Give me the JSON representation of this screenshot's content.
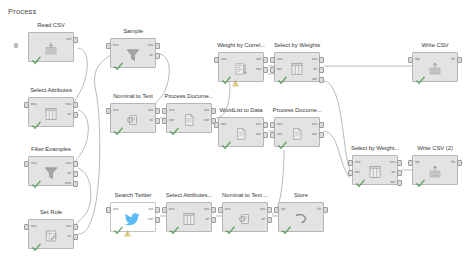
{
  "canvas": {
    "title": "Process",
    "background": "#ffffff",
    "node_fill": "#e3e3e3",
    "node_border": "#b6b6b6",
    "wire_color": "#b9b9b9",
    "text_color": "#3b3b3b",
    "twitter_blue": "#1da1f2",
    "width": 466,
    "height": 260
  },
  "nodes": [
    {
      "id": "read-csv",
      "label": "Read CSV",
      "icon": "read-csv-icon",
      "x": 28,
      "y": 32,
      "style": "grey",
      "check": true,
      "warn": false,
      "inputs": [],
      "outputs": [
        "out"
      ],
      "port_labels_in": [],
      "port_labels_out": [
        "out"
      ],
      "extra_left_nub": true
    },
    {
      "id": "select-attributes",
      "label": "Select Attributes",
      "icon": "table-columns-icon",
      "x": 28,
      "y": 97,
      "style": "grey",
      "check": true,
      "warn": false,
      "inputs": [
        "exa"
      ],
      "outputs": [
        "exa",
        "ori"
      ],
      "port_labels_in": [
        "exa"
      ],
      "port_labels_out": [
        "exa",
        "ori"
      ]
    },
    {
      "id": "filter-examples",
      "label": "Filter Examples",
      "icon": "funnel-icon",
      "x": 28,
      "y": 156,
      "style": "grey",
      "check": true,
      "warn": false,
      "inputs": [
        "exa"
      ],
      "outputs": [
        "exa",
        "ori",
        "unm"
      ],
      "port_labels_in": [
        "exa"
      ],
      "port_labels_out": [
        "exa",
        "ori",
        "unm"
      ]
    },
    {
      "id": "set-role",
      "label": "Set Role",
      "icon": "set-role-icon",
      "x": 28,
      "y": 219,
      "style": "grey",
      "check": true,
      "warn": false,
      "inputs": [
        "exa"
      ],
      "outputs": [
        "exa",
        "ori"
      ],
      "port_labels_in": [
        "exa"
      ],
      "port_labels_out": [
        "exa",
        "ori"
      ]
    },
    {
      "id": "sample",
      "label": "Sample",
      "icon": "funnel-icon",
      "x": 110,
      "y": 38,
      "style": "grey",
      "check": true,
      "warn": false,
      "inputs": [
        "exa"
      ],
      "outputs": [
        "exa",
        "ori"
      ],
      "port_labels_in": [
        "exa"
      ],
      "port_labels_out": [
        "exa",
        "ori"
      ]
    },
    {
      "id": "nominal-to-text",
      "label": "Nominal to Text",
      "icon": "nominal-to-text-icon",
      "x": 110,
      "y": 103,
      "style": "grey",
      "check": true,
      "warn": false,
      "inputs": [
        "exa"
      ],
      "outputs": [
        "exa",
        "ori"
      ],
      "port_labels_in": [
        "exa"
      ],
      "port_labels_out": [
        "exa",
        "ori"
      ]
    },
    {
      "id": "process-documents-1",
      "label": "Process Docume...",
      "icon": "document-icon",
      "x": 166,
      "y": 103,
      "style": "grey",
      "check": true,
      "warn": false,
      "inputs": [
        "exa",
        "wor"
      ],
      "outputs": [
        "exa",
        "wor"
      ],
      "port_labels_in": [
        "exa",
        "wor"
      ],
      "port_labels_out": [
        "exa",
        "wor"
      ]
    },
    {
      "id": "weight-by-correlation",
      "label": "Weight by Correl...",
      "icon": "weight-bars-icon",
      "x": 218,
      "y": 52,
      "style": "grey",
      "check": true,
      "warn": true,
      "inputs": [
        "exa"
      ],
      "outputs": [
        "wei",
        "exa"
      ],
      "port_labels_in": [
        "exa"
      ],
      "port_labels_out": [
        "wei",
        "exa"
      ]
    },
    {
      "id": "select-by-weights",
      "label": "Select by Weights",
      "icon": "table-columns-icon",
      "x": 274,
      "y": 52,
      "style": "grey",
      "check": true,
      "warn": false,
      "inputs": [
        "exa",
        "wei"
      ],
      "outputs": [
        "exa",
        "ori",
        "wei"
      ],
      "port_labels_in": [
        "exa",
        "wei"
      ],
      "port_labels_out": [
        "exa",
        "ori",
        "wei"
      ]
    },
    {
      "id": "wordlist-to-data",
      "label": "WordList to Data",
      "icon": "document-icon",
      "x": 218,
      "y": 117,
      "style": "grey",
      "check": true,
      "warn": false,
      "inputs": [
        "wor"
      ],
      "outputs": [
        "exa",
        "wor"
      ],
      "port_labels_in": [
        "wor"
      ],
      "port_labels_out": [
        "exa",
        "wor"
      ]
    },
    {
      "id": "process-documents-2",
      "label": "Process Docume...",
      "icon": "document-icon",
      "x": 274,
      "y": 117,
      "style": "grey",
      "check": true,
      "warn": false,
      "inputs": [
        "exa",
        "wor"
      ],
      "outputs": [
        "exa",
        "wor"
      ],
      "port_labels_in": [
        "exa",
        "wor"
      ],
      "port_labels_out": [
        "exa",
        "wor"
      ]
    },
    {
      "id": "search-twitter",
      "label": "Search Twitter",
      "icon": "twitter-bird-icon",
      "x": 110,
      "y": 202,
      "style": "white",
      "check": true,
      "warn": true,
      "inputs": [
        "con"
      ],
      "outputs": [
        "out",
        "con"
      ],
      "port_labels_in": [
        "con"
      ],
      "port_labels_out": [
        "out",
        "con"
      ]
    },
    {
      "id": "select-attributes-2",
      "label": "Select Attributes...",
      "icon": "table-columns-icon",
      "x": 166,
      "y": 202,
      "style": "grey",
      "check": true,
      "warn": false,
      "inputs": [
        "exa"
      ],
      "outputs": [
        "exa",
        "ori"
      ],
      "port_labels_in": [
        "exa"
      ],
      "port_labels_out": [
        "exa",
        "ori"
      ]
    },
    {
      "id": "nominal-to-text-2",
      "label": "Nominal to Text ...",
      "icon": "nominal-to-text-icon",
      "x": 222,
      "y": 202,
      "style": "grey",
      "check": true,
      "warn": false,
      "inputs": [
        "exa"
      ],
      "outputs": [
        "exa",
        "ori"
      ],
      "port_labels_in": [
        "exa"
      ],
      "port_labels_out": [
        "exa",
        "ori"
      ]
    },
    {
      "id": "store",
      "label": "Store",
      "icon": "store-icon",
      "x": 278,
      "y": 202,
      "style": "grey",
      "check": true,
      "warn": false,
      "inputs": [
        "inp"
      ],
      "outputs": [
        "thr"
      ],
      "port_labels_in": [
        "inp"
      ],
      "port_labels_out": [
        "thr"
      ]
    },
    {
      "id": "select-by-weights-2",
      "label": "Select by Weight...",
      "icon": "table-columns-icon",
      "x": 352,
      "y": 155,
      "style": "grey",
      "check": true,
      "warn": false,
      "inputs": [
        "exa",
        "wei"
      ],
      "outputs": [
        "exa",
        "ori",
        "wei"
      ],
      "port_labels_in": [
        "exa",
        "wei"
      ],
      "port_labels_out": [
        "exa",
        "ori",
        "wei"
      ]
    },
    {
      "id": "write-csv",
      "label": "Write CSV",
      "icon": "write-csv-icon",
      "x": 412,
      "y": 52,
      "style": "grey",
      "check": true,
      "warn": false,
      "inputs": [
        "inp"
      ],
      "outputs": [
        "thr"
      ],
      "port_labels_in": [
        "inp"
      ],
      "port_labels_out": [
        "thr"
      ]
    },
    {
      "id": "write-csv-2",
      "label": "Write CSV (2)",
      "icon": "write-csv-icon",
      "x": 412,
      "y": 155,
      "style": "grey",
      "check": true,
      "warn": false,
      "inputs": [
        "inp"
      ],
      "outputs": [
        "thr"
      ],
      "port_labels_in": [
        "inp"
      ],
      "port_labels_out": [
        "thr"
      ]
    }
  ],
  "connections": [
    {
      "from": "read-csv",
      "to": "select-attributes",
      "path": "M 78 48 C 92 50 88 78 80 92 C 74 103 68 108 74 112"
    },
    {
      "from": "select-attributes",
      "to": "filter-examples",
      "path": "M 78 110 C 92 114 90 140 82 152 C 76 162 68 166 74 171"
    },
    {
      "from": "filter-examples",
      "to": "set-role",
      "path": "M 78 168 C 94 174 94 206 84 216 C 78 223 68 228 74 234"
    },
    {
      "from": "set-role",
      "to": "sample",
      "path": "M 78 234 C 104 236 102 120 96 92 C 90 66 104 60 112 54"
    },
    {
      "from": "sample",
      "to": "nominal-to-text",
      "path": "M 160 54 C 174 58 170 84 162 96 C 152 108 146 112 156 118"
    },
    {
      "from": "nominal-to-text",
      "to": "process-documents-1",
      "path": "M 160 118 L 168 118"
    },
    {
      "from": "process-documents-1",
      "to": "weight-by-correlation",
      "path": "M 216 118 C 226 118 230 100 230 88 C 230 76 216 72 222 68"
    },
    {
      "from": "weight-by-correlation",
      "to": "select-by-weights",
      "path": "M 268 66 L 278 66"
    },
    {
      "from": "weight-by-correlation-wei",
      "to": "select-by-weights-wei",
      "path": "M 268 74 L 278 74"
    },
    {
      "from": "process-documents-1-wor",
      "to": "wordlist-to-data",
      "path": "M 216 126 C 224 126 218 130 222 132"
    },
    {
      "from": "wordlist-to-data",
      "to": "process-documents-2",
      "path": "M 268 131 L 278 131"
    },
    {
      "from": "select-by-weights",
      "to": "write-csv",
      "path": "M 324 66 L 416 66"
    },
    {
      "from": "select-by-weights",
      "to": "select-by-weights-2",
      "path": "M 324 81 C 344 84 342 152 350 170"
    },
    {
      "from": "process-documents-2",
      "to": "select-by-weights-2",
      "path": "M 324 131 C 340 134 338 164 350 178"
    },
    {
      "from": "select-by-weights-2",
      "to": "write-csv-2",
      "path": "M 402 170 L 416 170"
    },
    {
      "from": "search-twitter",
      "to": "select-attributes-2",
      "path": "M 160 216 L 170 216"
    },
    {
      "from": "select-attributes-2",
      "to": "nominal-to-text-2",
      "path": "M 216 216 L 226 216"
    },
    {
      "from": "nominal-to-text-2",
      "to": "store",
      "path": "M 272 216 L 282 216"
    },
    {
      "from": "store-branch",
      "to": "process-documents-2",
      "path": "M 272 214 C 282 212 284 168 284 150"
    }
  ]
}
